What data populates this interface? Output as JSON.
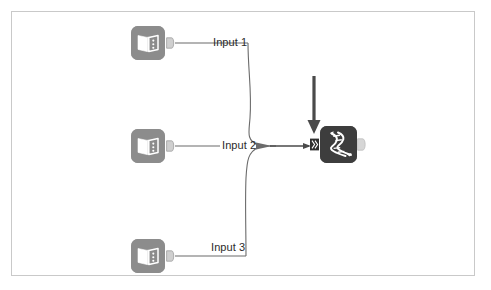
{
  "canvas": {
    "background_color": "#ffffff",
    "border_color": "#c9c9c9",
    "width": 491,
    "height": 290
  },
  "nodes": {
    "sources": [
      {
        "id": "source-1",
        "icon": "book-icon",
        "color": "#8c8c8c",
        "port_label": "Input 1"
      },
      {
        "id": "source-2",
        "icon": "book-icon",
        "color": "#8c8c8c",
        "port_label": "Input 2"
      },
      {
        "id": "source-3",
        "icon": "book-icon",
        "color": "#8c8c8c",
        "port_label": "Input 3"
      }
    ],
    "target": {
      "id": "target-1",
      "icon": "dna-helix-icon",
      "color": "#3d3d3d",
      "input_port_icon": "merge-input-port-icon",
      "output_port_icon": "output-port-icon"
    }
  },
  "edges": [
    {
      "from": "source-1",
      "to": "target-1",
      "label": "Input 1"
    },
    {
      "from": "source-2",
      "to": "target-1",
      "label": "Input 2"
    },
    {
      "from": "source-3",
      "to": "target-1",
      "label": "Input 3"
    }
  ],
  "annotations": {
    "down_arrow": {
      "icon": "down-arrow-icon",
      "color": "#4a4a4a"
    }
  },
  "labels": {
    "input_1": "Input 1",
    "input_2": "Input 2",
    "input_3": "Input 3"
  }
}
